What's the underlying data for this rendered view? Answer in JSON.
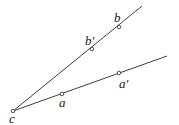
{
  "diagram": {
    "rays": [
      {
        "name": "upper-ray",
        "from": [
          13,
          111
        ],
        "to": [
          142,
          6
        ]
      },
      {
        "name": "lower-ray",
        "from": [
          13,
          111
        ],
        "to": [
          167,
          56
        ]
      }
    ],
    "points": [
      {
        "id": "c",
        "label": "c",
        "x": 13,
        "y": 111,
        "lx": 9,
        "ly": 123
      },
      {
        "id": "b-prime",
        "label": "b′",
        "x": 92,
        "y": 49,
        "lx": 85,
        "ly": 45
      },
      {
        "id": "b",
        "label": "b",
        "x": 119,
        "y": 27,
        "lx": 114,
        "ly": 22
      },
      {
        "id": "a",
        "label": "a",
        "x": 62,
        "y": 94,
        "lx": 59,
        "ly": 107
      },
      {
        "id": "a-prime",
        "label": "a′",
        "x": 119,
        "y": 73,
        "lx": 119,
        "ly": 88
      }
    ],
    "line_color": "#2a2a2a"
  }
}
